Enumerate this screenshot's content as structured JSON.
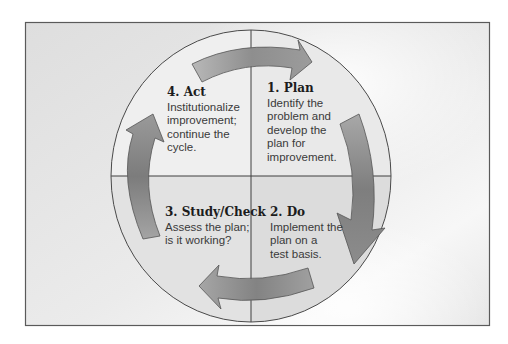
{
  "diagram": {
    "type": "cycle",
    "title": "",
    "colors": {
      "frame_fill": "#e3e3e3",
      "frame_border": "#5a5a5a",
      "circle_stroke": "#4a4a4a",
      "quadrant_top_left": "#efefef",
      "quadrant_top_right": "#e9e9e9",
      "quadrant_bottom_left": "#e2e2e2",
      "quadrant_bottom_right": "#dcdcdc",
      "arrow_light": "#b4b4b4",
      "arrow_dark": "#777777",
      "arrow_outline": "#555555"
    },
    "steps": [
      {
        "id": "plan",
        "heading": "1. Plan",
        "lines": [
          "Identify the",
          "problem and",
          "develop the",
          "plan for",
          "improvement."
        ],
        "quadrant": "top-right"
      },
      {
        "id": "do",
        "heading": "2. Do",
        "lines": [
          "Implement the",
          "plan on a",
          "test basis."
        ],
        "quadrant": "bottom-right"
      },
      {
        "id": "study-check",
        "heading": "3. Study/Check",
        "lines": [
          "Assess the plan;",
          "is it working?"
        ],
        "quadrant": "bottom-left"
      },
      {
        "id": "act",
        "heading": "4. Act",
        "lines": [
          "Institutionalize",
          "improvement;",
          "continue the",
          "cycle."
        ],
        "quadrant": "top-left"
      }
    ],
    "arrows": [
      {
        "from": "act",
        "to": "plan",
        "direction": "clockwise",
        "position": "top"
      },
      {
        "from": "plan",
        "to": "do",
        "direction": "clockwise",
        "position": "right"
      },
      {
        "from": "do",
        "to": "study-check",
        "direction": "clockwise",
        "position": "bottom"
      },
      {
        "from": "study-check",
        "to": "act",
        "direction": "clockwise",
        "position": "left"
      }
    ]
  }
}
